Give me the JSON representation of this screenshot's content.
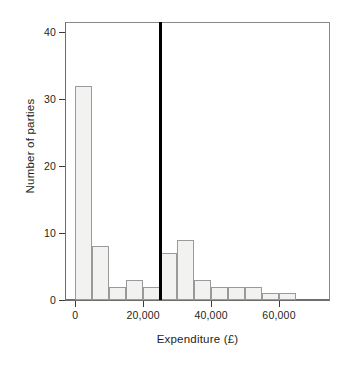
{
  "chart_data": {
    "type": "bar",
    "title": "",
    "subtitle": "",
    "xlabel": "Expenditure (£)",
    "ylabel": "Number of parties",
    "grid": false,
    "legend": "none",
    "bin_width": 5000,
    "xlim": [
      -3000,
      75000
    ],
    "ylim": [
      0,
      41.5
    ],
    "x_ticks": [
      0,
      20000,
      40000,
      60000
    ],
    "x_tick_labels": [
      "0",
      "20,000",
      "40,000",
      "60,000"
    ],
    "y_ticks": [
      0,
      10,
      20,
      30,
      40
    ],
    "y_tick_labels": [
      "0",
      "10",
      "20",
      "30",
      "40"
    ],
    "bin_starts": [
      0,
      5000,
      10000,
      15000,
      20000,
      25000,
      30000,
      35000,
      40000,
      45000,
      50000,
      55000,
      60000
    ],
    "bin_labels": [
      "0–5,000",
      "5,000–10,000",
      "10,000–15,000",
      "15,000–20,000",
      "20,000–25,000",
      "25,000–30,000",
      "30,000–35,000",
      "35,000–40,000",
      "40,000–45,000",
      "45,000–50,000",
      "50,000–55,000",
      "55,000–60,000",
      "60,000–65,000"
    ],
    "values": [
      32,
      8,
      2,
      3,
      2,
      7,
      9,
      3,
      2,
      2,
      2,
      1,
      1
    ],
    "annotations": [
      {
        "name": "reference-line",
        "type": "vline",
        "x": 25000,
        "color": "#000000"
      }
    ],
    "bar_fill": "#f2f2f0",
    "bar_stroke": "#9a9a9a",
    "axis_color": "#6e6e6e",
    "text_color": "#231f20"
  }
}
